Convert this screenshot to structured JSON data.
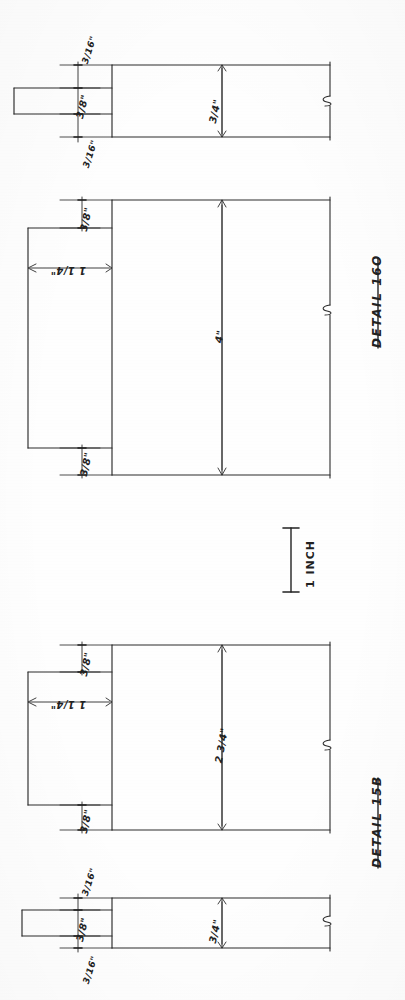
{
  "document": {
    "type": "hand-drawn technical detail drawing",
    "orientation": "landscape sheet scanned rotated 90 degrees",
    "ink_color": "#2b2b2b",
    "paper_color": "#fefefe"
  },
  "scale_bar": {
    "label": "1 INCH",
    "name": "scale-bar"
  },
  "details": [
    {
      "id": "detail-16o",
      "title": "DETAIL 16O",
      "section_view": {
        "name": "section-view-16o",
        "dimensions": [
          {
            "name": "tenon-shoulder-top",
            "value": "3/16\""
          },
          {
            "name": "tenon-thickness",
            "value": "3/8\""
          },
          {
            "name": "tenon-shoulder-bottom",
            "value": "3/16\""
          },
          {
            "name": "stock-width",
            "value": "3/4\""
          }
        ],
        "break_symbol": "break-line"
      },
      "face_view": {
        "name": "face-view-16o",
        "dimensions": [
          {
            "name": "tenon-shoulder-top",
            "value": "3/8\""
          },
          {
            "name": "tenon-length",
            "value": "1 1/4\""
          },
          {
            "name": "overall-height",
            "value": "4\""
          },
          {
            "name": "tenon-shoulder-bottom",
            "value": "3/8\""
          }
        ],
        "break_symbol": "break-line"
      }
    },
    {
      "id": "detail-15b",
      "title": "DETAIL 15B",
      "face_view": {
        "name": "face-view-15b",
        "dimensions": [
          {
            "name": "tenon-shoulder-top",
            "value": "3/8\""
          },
          {
            "name": "tenon-length",
            "value": "1 1/4\""
          },
          {
            "name": "overall-height",
            "value": "2 3/4\""
          },
          {
            "name": "tenon-shoulder-bottom",
            "value": "3/8\""
          }
        ],
        "break_symbol": "break-line"
      },
      "section_view": {
        "name": "section-view-15b",
        "dimensions": [
          {
            "name": "tenon-shoulder-top",
            "value": "3/16\""
          },
          {
            "name": "tenon-thickness",
            "value": "3/8\""
          },
          {
            "name": "tenon-shoulder-bottom",
            "value": "3/16\""
          },
          {
            "name": "stock-width",
            "value": "3/4\""
          }
        ],
        "break_symbol": "break-line"
      }
    }
  ]
}
